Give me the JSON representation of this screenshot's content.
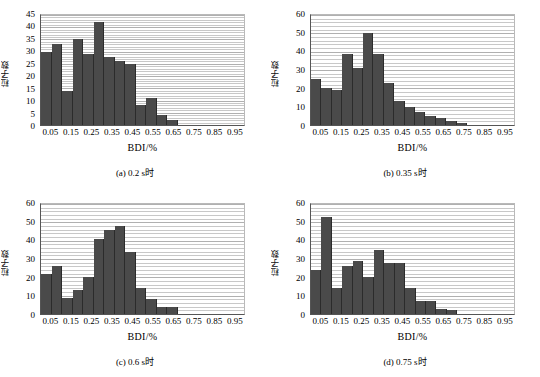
{
  "figure": {
    "type": "multi-panel-histogram",
    "panel_count": 4
  },
  "chart_data": [
    {
      "type": "bar",
      "panel": "a",
      "title": "",
      "caption": "(a) 0.2 s时",
      "xlabel": "BDI/%",
      "ylabel": "粒子数",
      "xlim": [
        0,
        1.0
      ],
      "ylim": [
        0,
        45
      ],
      "yticks": [
        0,
        5,
        10,
        15,
        20,
        25,
        30,
        35,
        40,
        45
      ],
      "xticks": [
        0.05,
        0.15,
        0.25,
        0.35,
        0.45,
        0.55,
        0.65,
        0.75,
        0.85,
        0.95
      ],
      "bin_width": 0.05,
      "grid": true,
      "legend": "none",
      "bin_centers": [
        0.025,
        0.075,
        0.125,
        0.175,
        0.225,
        0.275,
        0.325,
        0.375,
        0.425,
        0.475,
        0.525,
        0.575,
        0.625,
        0.675,
        0.725,
        0.775,
        0.825,
        0.875,
        0.925,
        0.975
      ],
      "values": [
        30,
        33,
        14,
        35,
        29,
        42,
        28,
        26,
        25,
        8,
        11,
        4,
        2,
        0,
        0,
        0,
        0,
        0,
        0,
        0
      ]
    },
    {
      "type": "bar",
      "panel": "b",
      "title": "",
      "caption": "(b) 0.35 s时",
      "xlabel": "BDI/%",
      "ylabel": "粒子数",
      "xlim": [
        0,
        1.0
      ],
      "ylim": [
        0,
        60
      ],
      "yticks": [
        0,
        10,
        20,
        30,
        40,
        50,
        60
      ],
      "xticks": [
        0.05,
        0.15,
        0.25,
        0.35,
        0.45,
        0.55,
        0.65,
        0.75,
        0.85,
        0.95
      ],
      "bin_width": 0.05,
      "grid": true,
      "legend": "none",
      "bin_centers": [
        0.025,
        0.075,
        0.125,
        0.175,
        0.225,
        0.275,
        0.325,
        0.375,
        0.425,
        0.475,
        0.525,
        0.575,
        0.625,
        0.675,
        0.725,
        0.775,
        0.825,
        0.875,
        0.925,
        0.975
      ],
      "values": [
        25,
        20,
        19,
        39,
        31,
        50,
        39,
        23,
        13,
        10,
        7,
        5,
        4,
        2,
        1,
        0,
        0,
        0,
        0,
        0
      ]
    },
    {
      "type": "bar",
      "panel": "c",
      "title": "",
      "caption": "(c) 0.6 s时",
      "xlabel": "BDI/%",
      "ylabel": "粒子数",
      "xlim": [
        0,
        1.0
      ],
      "ylim": [
        0,
        60
      ],
      "yticks": [
        0,
        10,
        20,
        30,
        40,
        50,
        60
      ],
      "xticks": [
        0.05,
        0.15,
        0.25,
        0.35,
        0.45,
        0.55,
        0.65,
        0.75,
        0.85,
        0.95
      ],
      "bin_width": 0.05,
      "grid": true,
      "legend": "none",
      "bin_centers": [
        0.025,
        0.075,
        0.125,
        0.175,
        0.225,
        0.275,
        0.325,
        0.375,
        0.425,
        0.475,
        0.525,
        0.575,
        0.625,
        0.675,
        0.725,
        0.775,
        0.825,
        0.875,
        0.925,
        0.975
      ],
      "values": [
        22,
        26,
        9,
        13,
        20,
        41,
        46,
        48,
        34,
        14,
        8,
        4,
        4,
        0,
        0,
        0,
        0,
        0,
        0,
        0
      ]
    },
    {
      "type": "bar",
      "panel": "d",
      "title": "",
      "caption": "(d) 0.75 s时",
      "xlabel": "BDI/%",
      "ylabel": "粒子数",
      "xlim": [
        0,
        1.0
      ],
      "ylim": [
        0,
        60
      ],
      "yticks": [
        0,
        10,
        20,
        30,
        40,
        50,
        60
      ],
      "xticks": [
        0.05,
        0.15,
        0.25,
        0.35,
        0.45,
        0.55,
        0.65,
        0.75,
        0.85,
        0.95
      ],
      "bin_width": 0.05,
      "grid": true,
      "legend": "none",
      "bin_centers": [
        0.025,
        0.075,
        0.125,
        0.175,
        0.225,
        0.275,
        0.325,
        0.375,
        0.425,
        0.475,
        0.525,
        0.575,
        0.625,
        0.675,
        0.725,
        0.775,
        0.825,
        0.875,
        0.925,
        0.975
      ],
      "values": [
        24,
        53,
        14,
        26,
        29,
        20,
        35,
        28,
        28,
        14,
        7,
        7,
        3,
        2,
        0,
        0,
        0,
        0,
        0,
        0
      ]
    }
  ],
  "style": {
    "bar_color": "#4a4a4a",
    "bar_edge_color": "#2b2b2b",
    "grid_color": "#c8c8c8",
    "axis_color": "#555555",
    "background": "#ffffff"
  }
}
